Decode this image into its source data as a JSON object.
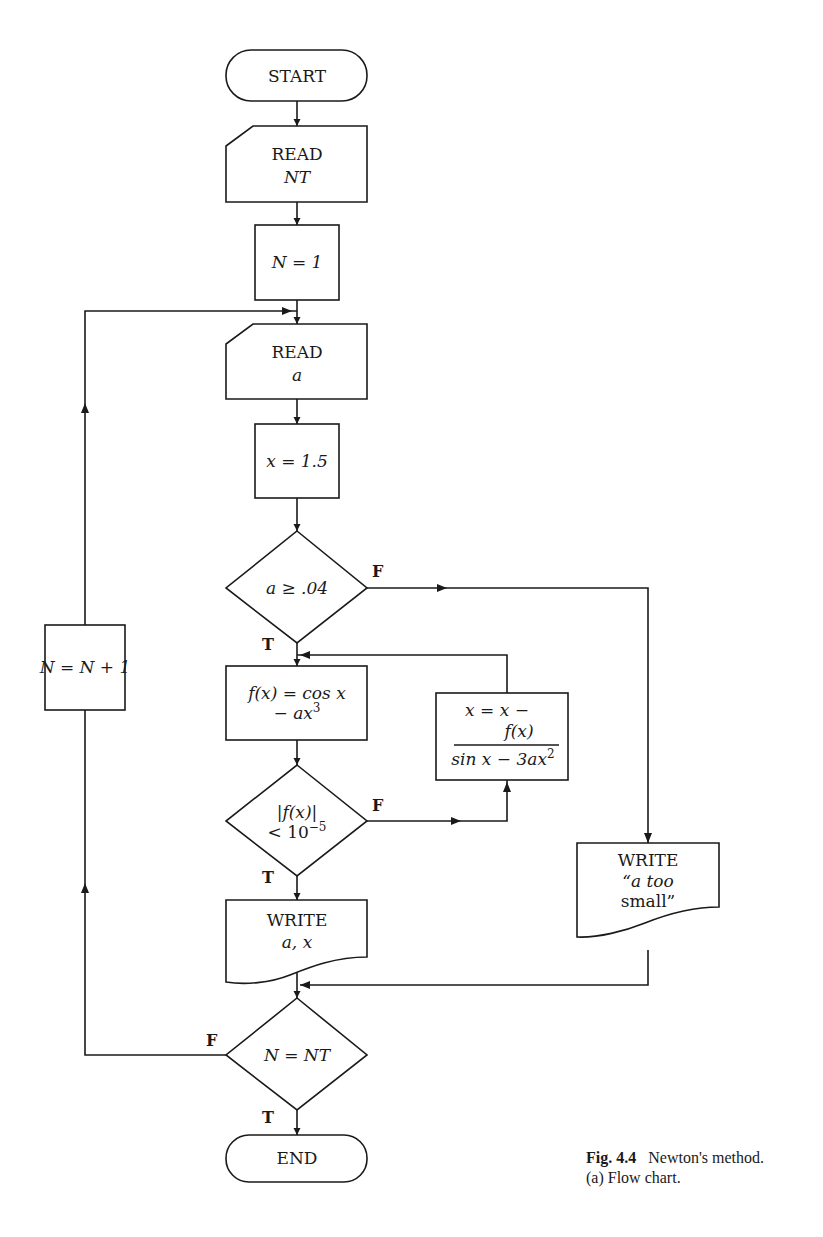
{
  "figure": {
    "caption_number": "Fig. 4.4",
    "caption_title": "Newton's method.",
    "caption_sub": "(a) Flow chart."
  },
  "nodes": {
    "start": {
      "type": "terminal",
      "label": "START"
    },
    "read_nt": {
      "type": "input",
      "line1": "READ",
      "line2": "NT"
    },
    "init_n": {
      "type": "process",
      "label": "N = 1"
    },
    "read_a": {
      "type": "input",
      "line1": "READ",
      "line2": "a"
    },
    "init_x": {
      "type": "process",
      "label": "x = 1.5"
    },
    "check_a": {
      "type": "decision",
      "label": "a ≥ .04",
      "true_label": "T",
      "false_label": "F"
    },
    "compute_f": {
      "type": "process",
      "line1": "f(x) = cos x",
      "line2": "− ax",
      "line2_sup": "3"
    },
    "check_conv": {
      "type": "decision",
      "line1": "|f(x)|",
      "line2": "< 10",
      "line2_sup": "−5",
      "true_label": "T",
      "false_label": "F"
    },
    "update_x": {
      "type": "process",
      "line1": "x = x −",
      "numerator": "f(x)",
      "denominator": "sin x − 3ax",
      "denominator_sup": "2"
    },
    "write_ax": {
      "type": "output",
      "line1": "WRITE",
      "line2": "a, x"
    },
    "write_small": {
      "type": "output",
      "line1": "WRITE",
      "line2": "“a too",
      "line3": "small”"
    },
    "inc_n": {
      "type": "process",
      "label": "N = N + 1"
    },
    "check_n": {
      "type": "decision",
      "label": "N = NT",
      "true_label": "T",
      "false_label": "F"
    },
    "end": {
      "type": "terminal",
      "label": "END"
    }
  },
  "edges": [
    {
      "from": "start",
      "to": "read_nt"
    },
    {
      "from": "read_nt",
      "to": "init_n"
    },
    {
      "from": "init_n",
      "to": "read_a"
    },
    {
      "from": "read_a",
      "to": "init_x"
    },
    {
      "from": "init_x",
      "to": "check_a"
    },
    {
      "from": "check_a",
      "to": "compute_f",
      "label": "T"
    },
    {
      "from": "check_a",
      "to": "write_small",
      "label": "F"
    },
    {
      "from": "compute_f",
      "to": "check_conv"
    },
    {
      "from": "check_conv",
      "to": "write_ax",
      "label": "T"
    },
    {
      "from": "check_conv",
      "to": "update_x",
      "label": "F"
    },
    {
      "from": "update_x",
      "to": "compute_f"
    },
    {
      "from": "write_ax",
      "to": "check_n"
    },
    {
      "from": "write_small",
      "to": "check_n"
    },
    {
      "from": "check_n",
      "to": "end",
      "label": "T"
    },
    {
      "from": "check_n",
      "to": "inc_n",
      "label": "F"
    },
    {
      "from": "inc_n",
      "to": "read_a"
    }
  ]
}
